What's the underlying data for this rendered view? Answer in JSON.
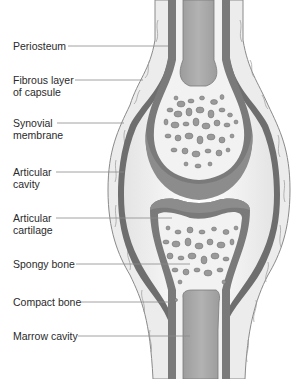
{
  "diagram": {
    "colors": {
      "background": "#ffffff",
      "fibrous_capsule": "#ececec",
      "fibrous_outline": "#8a8a8a",
      "synovial_membrane": "#6e6e6e",
      "cartilage": "#8c8c8c",
      "articular_cavity": "#f4f4f4",
      "bone_spongy_bg": "#f2f2f2",
      "trabeculae": "#9a9a9a",
      "marrow": "#a6a6a6",
      "leader_line": "#8a8a8a",
      "text": "#2a2a2a"
    },
    "labels": [
      {
        "id": "periosteum",
        "lines": [
          "Periosteum"
        ],
        "text_x": 13,
        "text_y": 40,
        "line_y": 46,
        "line_x1": 68,
        "line_x2": 168
      },
      {
        "id": "fibrous-layer",
        "lines": [
          "Fibrous layer",
          "of capsule"
        ],
        "text_x": 13,
        "text_y": 74,
        "line_y": 80,
        "line_x1": 75,
        "line_x2": 143
      },
      {
        "id": "synovial-membrane",
        "lines": [
          "Synovial",
          "membrane"
        ],
        "text_x": 13,
        "text_y": 116,
        "line_y": 123,
        "line_x1": 57,
        "line_x2": 124
      },
      {
        "id": "articular-cavity",
        "lines": [
          "Articular",
          "cavity"
        ],
        "text_x": 13,
        "text_y": 164,
        "line_y": 172,
        "line_x1": 56,
        "line_x2": 124
      },
      {
        "id": "articular-cartilage",
        "lines": [
          "Articular",
          "cartilage"
        ],
        "text_x": 13,
        "text_y": 208,
        "line_y": 218,
        "line_x1": 56,
        "line_x2": 172
      },
      {
        "id": "spongy-bone",
        "lines": [
          "Spongy bone"
        ],
        "text_x": 13,
        "text_y": 258,
        "line_y": 264,
        "line_x1": 76,
        "line_x2": 190
      },
      {
        "id": "compact-bone",
        "lines": [
          "Compact bone"
        ],
        "text_x": 13,
        "text_y": 297,
        "line_y": 302,
        "line_x1": 81,
        "line_x2": 170
      },
      {
        "id": "marrow-cavity",
        "lines": [
          "Marrow cavity"
        ],
        "text_x": 13,
        "text_y": 330,
        "line_y": 336,
        "line_x1": 78,
        "line_x2": 190
      }
    ]
  }
}
